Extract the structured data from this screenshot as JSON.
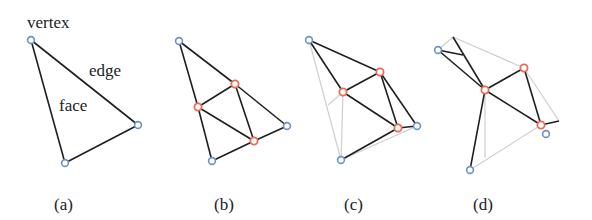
{
  "colors": {
    "edge": "#1f1f1f",
    "ghost_edge": "#cfcfcf",
    "original_vertex": "#6a92c8",
    "new_vertex": "#ec6a55",
    "text": "#222222"
  },
  "annotations": {
    "vertex": "vertex",
    "edge": "edge",
    "face": "face"
  },
  "panels": [
    {
      "id": "a",
      "caption": "(a)"
    },
    {
      "id": "b",
      "caption": "(b)"
    },
    {
      "id": "c",
      "caption": "(c)"
    },
    {
      "id": "d",
      "caption": "(d)"
    }
  ]
}
